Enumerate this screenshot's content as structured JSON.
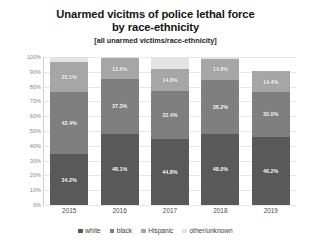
{
  "chart_data": {
    "type": "bar",
    "subtype": "stacked-bar-100",
    "title": "Unarmed vicitms of police lethal force by race-ethnicity",
    "title_lines": [
      "Unarmed vicitms of police lethal force",
      "by race-ethnicity"
    ],
    "subtitle": "[all unarmed victims/race-ethnicity]",
    "xlabel": "",
    "ylabel": "",
    "ylim": [
      0,
      100
    ],
    "grid": true,
    "legend_position": "bottom",
    "categories": [
      "2015",
      "2016",
      "2017",
      "2018",
      "2019"
    ],
    "ytick_labels": [
      "0%",
      "10%",
      "20%",
      "30%",
      "40%",
      "50%",
      "60%",
      "70%",
      "80%",
      "90%",
      "100%"
    ],
    "ytick_values": [
      0,
      10,
      20,
      30,
      40,
      50,
      60,
      70,
      80,
      90,
      100
    ],
    "series": [
      {
        "name": "white",
        "color": "#595959",
        "values": [
          34.2,
          48.1,
          44.8,
          48.0,
          46.2
        ],
        "labels": [
          "34.2%",
          "48.1%",
          "44.8%",
          "48.0%",
          "46.2%"
        ]
      },
      {
        "name": "black",
        "color": "#7f7f7f",
        "values": [
          42.4,
          37.3,
          32.4,
          36.2,
          30.0
        ],
        "labels": [
          "42.4%",
          "37.3%",
          "32.4%",
          "36.2%",
          "30.0%"
        ]
      },
      {
        "name": "Hispanic",
        "color": "#a6a6a6",
        "values": [
          20.1,
          13.6,
          14.8,
          14.8,
          14.4
        ],
        "labels": [
          "20.1%",
          "13.6%",
          "14.8%",
          "14.8%",
          "14.4%"
        ]
      },
      {
        "name": "other/unknown",
        "color": "#e3e3e3",
        "values": [
          3.3,
          1.0,
          8.0,
          1.0,
          0.0
        ],
        "labels": [
          "",
          "",
          "",
          "",
          ""
        ]
      }
    ],
    "bar_totals": [
      100.0,
      100.0,
      100.0,
      100.0,
      90.6
    ]
  },
  "legend": {
    "items": [
      {
        "label": "white",
        "color": "#595959"
      },
      {
        "label": "black",
        "color": "#7f7f7f"
      },
      {
        "label": "Hispanic",
        "color": "#a6a6a6"
      },
      {
        "label": "other/unknown",
        "color": "#e3e3e3"
      }
    ]
  },
  "colors": {
    "background": "#ffffff",
    "gridline": "#e6e6e6",
    "axis": "#d2d2d2",
    "tick_text": "#8a8a8a",
    "label_text": "#4a4a4a",
    "title_text": "#141414"
  }
}
